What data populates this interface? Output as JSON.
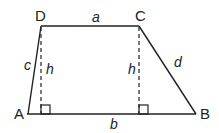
{
  "diagram": {
    "type": "trapezoid",
    "colors": {
      "stroke": "#222222",
      "background": "#ffffff"
    },
    "vertices": {
      "A": {
        "label": "A",
        "x": 28,
        "y": 114
      },
      "B": {
        "label": "B",
        "x": 196,
        "y": 114
      },
      "C": {
        "label": "C",
        "x": 139,
        "y": 26
      },
      "D": {
        "label": "D",
        "x": 41,
        "y": 26
      }
    },
    "sides": {
      "top": {
        "label": "a",
        "from": "D",
        "to": "C"
      },
      "bottom": {
        "label": "b",
        "from": "A",
        "to": "B"
      },
      "left": {
        "label": "c",
        "from": "A",
        "to": "D"
      },
      "right": {
        "label": "d",
        "from": "C",
        "to": "B"
      }
    },
    "heights": [
      {
        "label": "h",
        "from": "D",
        "style": "dashed",
        "right_angle_marker": true
      },
      {
        "label": "h",
        "from": "C",
        "style": "dashed",
        "right_angle_marker": true
      }
    ]
  }
}
